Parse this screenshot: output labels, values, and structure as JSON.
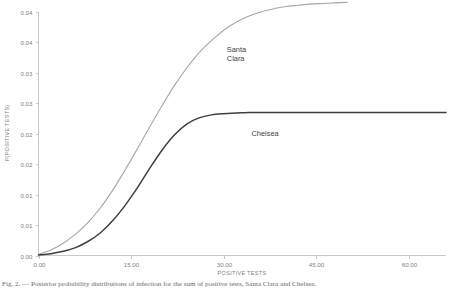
{
  "chart_data": {
    "type": "line",
    "title": "",
    "xlabel": "POSITIVE TESTS",
    "ylabel": "P(POSITIVE TESTS)",
    "xlim": [
      0,
      66
    ],
    "ylim": [
      0,
      0.04
    ],
    "grid": false,
    "legend_position": "inline-annotation",
    "xticks": [
      0,
      15,
      30,
      45,
      60
    ],
    "xticklabels": [
      "0.00",
      "15.00",
      "30.00",
      "45.00",
      "60.00"
    ],
    "yticks": [
      0.0,
      0.005,
      0.01,
      0.015,
      0.02,
      0.025,
      0.03,
      0.035,
      0.04
    ],
    "yticklabels": [
      "0.00",
      "0.01",
      "0.01",
      "0.02",
      "0.02",
      "0.03",
      "0.03",
      "0.04",
      "0.04"
    ],
    "series": [
      {
        "name": "Santa Clara",
        "color": "#a6a6a6",
        "width": 1.1,
        "label_x": 30.5,
        "label_y": 0.0335,
        "x": [
          0,
          2,
          4,
          6,
          8,
          10,
          12,
          14,
          16,
          18,
          20,
          22,
          24,
          26,
          28,
          30,
          32,
          34,
          36,
          38,
          40,
          42,
          44,
          46,
          48,
          50
        ],
        "y": [
          0.0002,
          0.0009,
          0.002,
          0.0035,
          0.0054,
          0.0078,
          0.0107,
          0.014,
          0.0175,
          0.0211,
          0.0246,
          0.0279,
          0.0308,
          0.0333,
          0.0353,
          0.037,
          0.0383,
          0.0393,
          0.04,
          0.0405,
          0.0409,
          0.0411,
          0.0413,
          0.0414,
          0.0415,
          0.0416
        ]
      },
      {
        "name": "Chelsea",
        "color": "#3f3f3f",
        "width": 1.5,
        "label_x": 34.5,
        "label_y": 0.0197,
        "x": [
          0,
          2,
          4,
          6,
          8,
          10,
          12,
          14,
          16,
          18,
          20,
          22,
          24,
          26,
          28,
          30,
          32,
          34,
          36,
          38,
          40,
          44,
          48,
          52,
          56,
          60,
          64,
          66
        ],
        "y": [
          0.0001,
          0.0003,
          0.0007,
          0.0013,
          0.0023,
          0.0037,
          0.0057,
          0.0082,
          0.0111,
          0.0143,
          0.0173,
          0.0198,
          0.0216,
          0.0226,
          0.0231,
          0.0233,
          0.0234,
          0.0235,
          0.0235,
          0.0235,
          0.0235,
          0.0235,
          0.0235,
          0.0235,
          0.0235,
          0.0235,
          0.0235,
          0.0235
        ]
      }
    ]
  },
  "caption": {
    "text": "Fig. 2. — Posterior probability distributions of infection for the sum of positive tests, Santa Clara and Chelsea."
  }
}
